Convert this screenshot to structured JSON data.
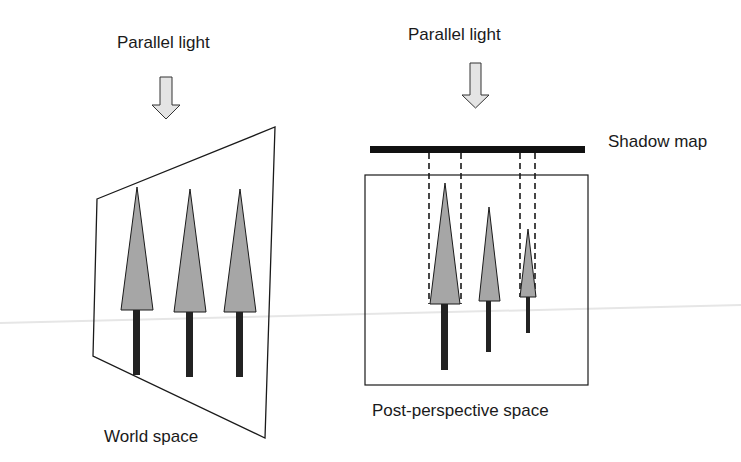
{
  "left_panel": {
    "light_label": "Parallel light",
    "space_label": "World space",
    "plane": {
      "points": [
        [
          97,
          199
        ],
        [
          275,
          127
        ],
        [
          265,
          438
        ],
        [
          93,
          356
        ]
      ]
    },
    "trees": [
      {
        "apex": [
          137,
          187
        ],
        "base_y": 310,
        "base_x": [
          121,
          153
        ],
        "trunk_x": [
          133,
          140
        ],
        "trunk_y": [
          310,
          375
        ]
      },
      {
        "apex": [
          190,
          189
        ],
        "base_y": 312,
        "base_x": [
          174,
          206
        ],
        "trunk_x": [
          186,
          193
        ],
        "trunk_y": [
          312,
          377
        ]
      },
      {
        "apex": [
          240,
          189
        ],
        "base_y": 312,
        "base_x": [
          224,
          256
        ],
        "trunk_x": [
          236,
          243
        ],
        "trunk_y": [
          312,
          377
        ]
      }
    ]
  },
  "right_panel": {
    "light_label": "Parallel light",
    "shadow_map_label": "Shadow map",
    "space_label": "Post-perspective space",
    "trees": [
      {
        "apex": [
          445,
          183
        ],
        "base_y": 304,
        "base_x": [
          430,
          460
        ],
        "trunk_x": [
          441,
          448
        ],
        "trunk_y": [
          304,
          370
        ]
      },
      {
        "apex": [
          489,
          207
        ],
        "base_y": 301,
        "base_x": [
          479,
          500
        ],
        "trunk_x": [
          486,
          491
        ],
        "trunk_y": [
          301,
          352
        ]
      },
      {
        "apex": [
          528,
          229
        ],
        "base_y": 297,
        "base_x": [
          520,
          536
        ],
        "trunk_x": [
          526,
          530
        ],
        "trunk_y": [
          297,
          333
        ]
      }
    ],
    "projection_lines_x": [
      429,
      461,
      520,
      535
    ]
  },
  "colors": {
    "stroke": "#1a1a1a",
    "tree_fill": "#a6a6a6",
    "trunk": "#222222",
    "arrow_fill": "#e4e4e4",
    "shadow_map_bar": "#111111"
  }
}
